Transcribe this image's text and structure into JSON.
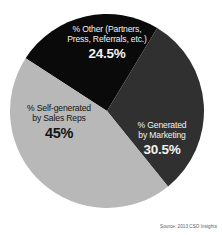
{
  "chart_data": {
    "type": "pie",
    "title": "",
    "subtitle": "",
    "xlabel": "",
    "ylabel": "",
    "grid": false,
    "legend_position": "none",
    "labels_inside_slices": true,
    "source": "Source: 2013 CSO Insights",
    "categories": [
      "% Other (Partners, Press, Referrals, etc.)",
      "% Generated by Marketing",
      "% Self-generated by Sales Reps"
    ],
    "values": [
      24.5,
      30.5,
      45
    ],
    "colors": [
      "#0a0a0a",
      "#303030",
      "#b8b8b8"
    ],
    "slices": [
      {
        "key": "other",
        "label_line1": "% Other (Partners,",
        "label_line2": "Press, Referrals, etc.)",
        "value": 24.5,
        "value_display": "24.5%",
        "color": "#0a0a0a",
        "text_color": "#f2f2f2"
      },
      {
        "key": "marketing",
        "label_line1": "% Generated",
        "label_line2": "by Marketing",
        "value": 30.5,
        "value_display": "30.5%",
        "color": "#303030",
        "text_color": "#f2f2f2"
      },
      {
        "key": "self-generated",
        "label_line1": "% Self-generated",
        "label_line2": "by Sales Reps",
        "value": 45,
        "value_display": "45%",
        "color": "#b8b8b8",
        "text_color": "#141414"
      }
    ]
  },
  "figure": {
    "background": "#ffffff"
  }
}
